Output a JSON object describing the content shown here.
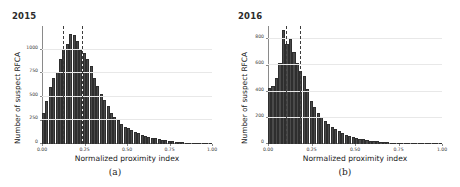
{
  "figure": {
    "panels": [
      {
        "key": "a",
        "title": "2015",
        "subcaption": "(a)",
        "xlabel": "Normalized proximity index",
        "ylabel": "Number of suspect RFCA"
      },
      {
        "key": "b",
        "title": "2016",
        "subcaption": "(b)",
        "xlabel": "Normalized proximity index",
        "ylabel": "Number of suspect RFCA"
      }
    ]
  },
  "chart_data": [
    {
      "type": "bar",
      "title": "2015",
      "subcaption": "(a)",
      "xlabel": "Normalized proximity index",
      "ylabel": "Number of suspect RFCA",
      "xlim": [
        0.0,
        1.0
      ],
      "ylim": [
        0,
        1250
      ],
      "grid": true,
      "legend": "none",
      "xticks": [
        0.0,
        0.25,
        0.5,
        0.75,
        1.0
      ],
      "xtick_labels": [
        "0.00",
        "0.25",
        "0.50",
        "0.75",
        "1.00"
      ],
      "yticks": [
        0,
        250,
        500,
        750,
        1000
      ],
      "ytick_labels": [
        "0",
        "250",
        "500",
        "750",
        "1000"
      ],
      "bin_width": 0.02,
      "annotations": [
        {
          "type": "vline",
          "style": "dashed",
          "x": 0.125,
          "color": "#3c3c3c"
        },
        {
          "type": "vline",
          "style": "dashed",
          "x": 0.235,
          "color": "#3c3c3c"
        }
      ],
      "x": [
        0.01,
        0.03,
        0.05,
        0.07,
        0.09,
        0.11,
        0.13,
        0.15,
        0.17,
        0.19,
        0.21,
        0.23,
        0.25,
        0.27,
        0.29,
        0.31,
        0.33,
        0.35,
        0.37,
        0.39,
        0.41,
        0.43,
        0.45,
        0.47,
        0.49,
        0.51,
        0.53,
        0.55,
        0.57,
        0.59,
        0.61,
        0.63,
        0.65,
        0.67,
        0.69,
        0.71,
        0.73,
        0.75,
        0.77,
        0.79,
        0.81,
        0.83,
        0.85,
        0.87,
        0.89,
        0.91,
        0.93,
        0.95,
        0.97,
        0.99
      ],
      "values": [
        330,
        455,
        600,
        700,
        760,
        900,
        1010,
        1060,
        1170,
        1150,
        1090,
        1000,
        960,
        900,
        830,
        700,
        610,
        530,
        470,
        400,
        330,
        285,
        250,
        215,
        185,
        170,
        150,
        130,
        115,
        100,
        88,
        78,
        68,
        60,
        52,
        45,
        40,
        35,
        30,
        26,
        22,
        19,
        16,
        14,
        12,
        10,
        8,
        7,
        6,
        5
      ]
    },
    {
      "type": "bar",
      "title": "2016",
      "subcaption": "(b)",
      "xlabel": "Normalized proximity index",
      "ylabel": "Number of suspect RFCA",
      "xlim": [
        0.0,
        1.0
      ],
      "ylim": [
        0,
        900
      ],
      "grid": true,
      "legend": "none",
      "xticks": [
        0.0,
        0.25,
        0.5,
        0.75,
        1.0
      ],
      "xtick_labels": [
        "0.00",
        "0.25",
        "0.50",
        "0.75",
        "1.00"
      ],
      "yticks": [
        0,
        200,
        400,
        600,
        800
      ],
      "ytick_labels": [
        "0",
        "200",
        "400",
        "600",
        "800"
      ],
      "bin_width": 0.02,
      "annotations": [
        {
          "type": "vline",
          "style": "dashed",
          "x": 0.105,
          "color": "#3c3c3c"
        },
        {
          "type": "vline",
          "style": "dashed",
          "x": 0.185,
          "color": "#3c3c3c"
        }
      ],
      "x": [
        0.01,
        0.03,
        0.05,
        0.07,
        0.09,
        0.11,
        0.13,
        0.15,
        0.17,
        0.19,
        0.21,
        0.23,
        0.25,
        0.27,
        0.29,
        0.31,
        0.33,
        0.35,
        0.37,
        0.39,
        0.41,
        0.43,
        0.45,
        0.47,
        0.49,
        0.51,
        0.53,
        0.55,
        0.57,
        0.59,
        0.61,
        0.63,
        0.65,
        0.67,
        0.69,
        0.71,
        0.73,
        0.75,
        0.77,
        0.79,
        0.81,
        0.83,
        0.85,
        0.87,
        0.89,
        0.91,
        0.93,
        0.95,
        0.97,
        0.99
      ],
      "values": [
        430,
        440,
        500,
        620,
        870,
        760,
        800,
        700,
        620,
        560,
        520,
        420,
        330,
        280,
        240,
        205,
        175,
        150,
        130,
        112,
        96,
        84,
        72,
        62,
        54,
        46,
        40,
        35,
        30,
        26,
        23,
        20,
        17,
        15,
        13,
        11,
        10,
        9,
        8,
        7,
        6,
        5,
        5,
        4,
        4,
        3,
        3,
        2,
        2,
        2
      ]
    }
  ]
}
